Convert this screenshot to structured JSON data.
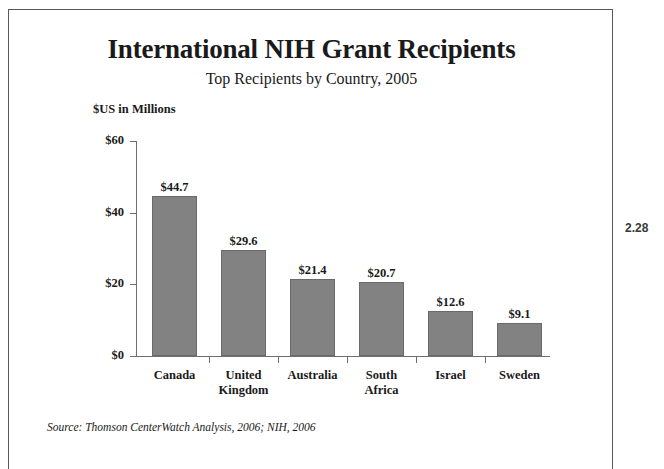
{
  "figure": {
    "margin_note": "2.28",
    "source_note": "Source: Thomson CenterWatch Analysis, 2006; NIH, 2006"
  },
  "chart_data": {
    "type": "bar",
    "title": "International NIH Grant Recipients",
    "subtitle": "Top Recipients by Country, 2005",
    "xlabel": "",
    "ylabel": "$US in Millions",
    "ylim": [
      0,
      60
    ],
    "ytick_values": [
      60,
      40,
      20,
      0
    ],
    "ytick_labels": [
      "$60",
      "$40",
      "$20",
      "$0"
    ],
    "grid": false,
    "legend": false,
    "categories": [
      "Canada",
      "United\nKingdom",
      "Australia",
      "South\nAfrica",
      "Israel",
      "Sweden"
    ],
    "values": [
      44.7,
      29.6,
      21.4,
      20.7,
      12.6,
      9.1
    ],
    "data_labels": [
      "$44.7",
      "$29.6",
      "$21.4",
      "$20.7",
      "$12.6",
      "$9.1"
    ],
    "bar_color": "#828282",
    "bar_edge_color": "#6a6a6a",
    "axis_color": "#6f6f6f"
  }
}
